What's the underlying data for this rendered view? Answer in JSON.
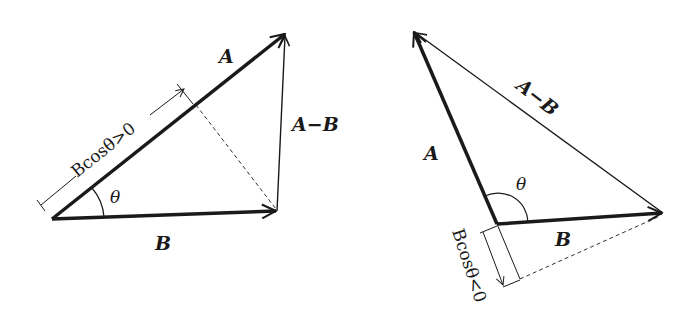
{
  "figure": {
    "left": {
      "caption": "acute angle case",
      "labels": {
        "A": "A",
        "B": "B",
        "A_minus_B": "A−B",
        "theta": "θ",
        "projection": "Bcosθ>0"
      }
    },
    "right": {
      "caption": "obtuse angle case",
      "labels": {
        "A": "A",
        "B": "B",
        "A_minus_B": "A−B",
        "theta": "θ",
        "projection": "Bcosθ<0"
      }
    }
  },
  "colors": {
    "stroke": "#1a1a1a",
    "background": "#ffffff"
  }
}
